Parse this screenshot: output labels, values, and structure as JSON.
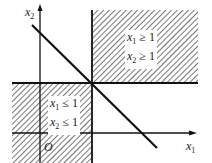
{
  "diagram": {
    "type": "feasible-region-plot",
    "axes": {
      "x_label": "x1",
      "y_label": "x2",
      "origin_label": "O"
    },
    "regions": [
      {
        "id": "upper-right",
        "constraints": [
          "x1 ≥ 1",
          "x2 ≥ 1"
        ],
        "hatched": true
      },
      {
        "id": "lower-left",
        "constraints": [
          "x1 ≤ 1",
          "x2 ≤ 1"
        ],
        "hatched": true
      }
    ],
    "lines": [
      {
        "id": "vertical-x1-eq-1"
      },
      {
        "id": "horizontal-x2-eq-1"
      },
      {
        "id": "diagonal-line"
      }
    ],
    "colors": {
      "line": "#111111",
      "hatch": "#555555",
      "background": "#ffffff"
    }
  },
  "labels": {
    "x1_var": "x",
    "x1_sub": "1",
    "x2_var": "x",
    "x2_sub": "2",
    "origin": "O",
    "ur_line1_var": "x",
    "ur_line1_sub": "1",
    "ur_line1_rel": " ≥ 1",
    "ur_line2_var": "x",
    "ur_line2_sub": "2",
    "ur_line2_rel": " ≥ 1",
    "ll_line1_var": "x",
    "ll_line1_sub": "1",
    "ll_line1_rel": " ≤ 1",
    "ll_line2_var": "x",
    "ll_line2_sub": "2",
    "ll_line2_rel": " ≤ 1"
  }
}
